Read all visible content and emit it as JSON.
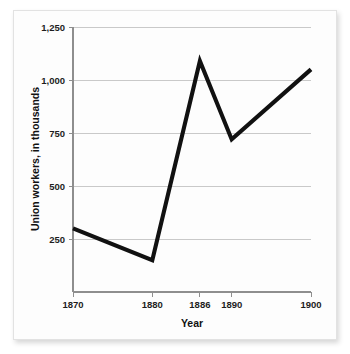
{
  "chart_data": {
    "type": "line",
    "title": "",
    "xlabel": "Year",
    "ylabel": "Union workers, in thousands",
    "x": [
      1870,
      1880,
      1886,
      1890,
      1900
    ],
    "categories": [
      "1870",
      "1880",
      "1886",
      "1890",
      "1900"
    ],
    "values": [
      300,
      150,
      1090,
      720,
      1050
    ],
    "series": [
      {
        "name": "Union workers",
        "values": [
          300,
          150,
          1090,
          720,
          1050
        ]
      }
    ],
    "xlim": [
      1870,
      1900
    ],
    "ylim": [
      0,
      1250
    ],
    "xticks": [
      1870,
      1880,
      1886,
      1890,
      1900
    ],
    "xtick_labels": [
      "1870",
      "1880",
      "1886",
      "1890",
      "1900"
    ],
    "yticks": [
      250,
      500,
      750,
      1000,
      1250
    ],
    "ytick_labels": [
      "250",
      "500",
      "750",
      "1,000",
      "1,250"
    ],
    "grid": "horizontal",
    "legend": "none",
    "line_color": "#111111",
    "grid_color": "#c9c9c9",
    "axis_color": "#8e8e8e",
    "background_color": "#fdfdfd",
    "markers": "none"
  },
  "axis": {
    "y_title": "Union workers, in thousands",
    "x_title": "Year",
    "y_labels": {
      "t0": "250",
      "t1": "500",
      "t2": "750",
      "t3": "1,000",
      "t4": "1,250"
    },
    "x_labels": {
      "t0": "1870",
      "t1": "1880",
      "t2": "1886",
      "t3": "1890",
      "t4": "1900"
    }
  }
}
